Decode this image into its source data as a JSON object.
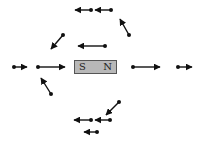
{
  "diagram": {
    "magnet": {
      "south_label": "S",
      "north_label": "N",
      "fill_color": "#b8b8b8",
      "border_color": "#555555"
    },
    "arrow_color": "#111111",
    "vectors": [
      {
        "id": "top-row-right",
        "from": [
          111,
          10
        ],
        "to": [
          95,
          10
        ]
      },
      {
        "id": "top-row-left",
        "from": [
          91,
          10
        ],
        "to": [
          75,
          10
        ]
      },
      {
        "id": "upper-right-diagonal",
        "from": [
          129,
          35
        ],
        "to": [
          120,
          19
        ]
      },
      {
        "id": "upper-middle",
        "from": [
          105,
          46
        ],
        "to": [
          78,
          46
        ]
      },
      {
        "id": "upper-left-diagonal",
        "from": [
          63,
          35
        ],
        "to": [
          51,
          49
        ]
      },
      {
        "id": "left-outer",
        "from": [
          14,
          67
        ],
        "to": [
          27,
          67
        ]
      },
      {
        "id": "left-inner",
        "from": [
          38,
          67
        ],
        "to": [
          65,
          67
        ]
      },
      {
        "id": "lower-left-diagonal",
        "from": [
          51,
          94
        ],
        "to": [
          41,
          78
        ]
      },
      {
        "id": "right-inner",
        "from": [
          133,
          67
        ],
        "to": [
          160,
          67
        ]
      },
      {
        "id": "right-outer",
        "from": [
          178,
          67
        ],
        "to": [
          192,
          67
        ]
      },
      {
        "id": "lower-right-diagonal",
        "from": [
          119,
          102
        ],
        "to": [
          106,
          115
        ]
      },
      {
        "id": "bottom-row-right",
        "from": [
          110,
          120
        ],
        "to": [
          95,
          120
        ]
      },
      {
        "id": "bottom-row-left",
        "from": [
          91,
          120
        ],
        "to": [
          74,
          120
        ]
      },
      {
        "id": "bottom-small",
        "from": [
          97,
          132
        ],
        "to": [
          84,
          132
        ]
      }
    ]
  }
}
